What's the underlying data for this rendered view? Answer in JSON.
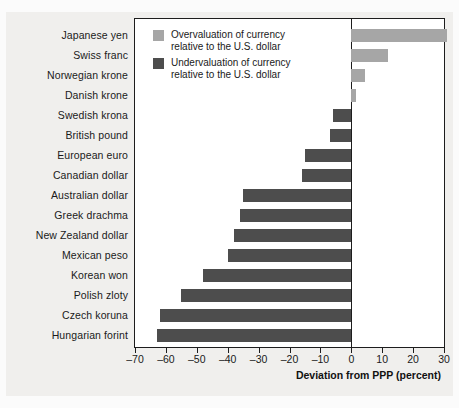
{
  "chart_data": {
    "type": "bar",
    "orientation": "horizontal",
    "title": "",
    "xlabel": "Deviation from PPP (percent)",
    "ylabel": "",
    "xlim": [
      -70,
      30
    ],
    "xticks": [
      -70,
      -60,
      -50,
      -40,
      -30,
      -20,
      -10,
      0,
      10,
      20,
      30
    ],
    "xticklabels": [
      "–70",
      "–60",
      "–50",
      "–40",
      "–30",
      "–20",
      "–10",
      "0",
      "10",
      "20",
      "30"
    ],
    "grid": false,
    "categories": [
      "Japanese yen",
      "Swiss franc",
      "Norwegian krone",
      "Danish krone",
      "Swedish krona",
      "British pound",
      "European euro",
      "Canadian dollar",
      "Australian dollar",
      "Greek drachma",
      "New Zealand dollar",
      "Mexican peso",
      "Korean won",
      "Polish zloty",
      "Czech koruna",
      "Hungarian forint"
    ],
    "values": [
      31,
      12,
      4.5,
      1.5,
      -6,
      -7,
      -15,
      -16,
      -35,
      -36,
      -38,
      -40,
      -48,
      -55,
      -62,
      -63
    ],
    "colors": {
      "positive": "#a6a6a6",
      "negative": "#4d4d4d",
      "axis": "#1d1d1d",
      "plot_background": "#ffffff",
      "figure_background": "#f0efed"
    },
    "legend": {
      "position": "top-left-inside",
      "entries": [
        {
          "key": "positive",
          "line1": "Overvaluation of currency",
          "line2": "relative to the U.S. dollar",
          "color": "#a6a6a6"
        },
        {
          "key": "negative",
          "line1": "Undervaluation of currency",
          "line2": "relative to the U.S. dollar",
          "color": "#4d4d4d"
        }
      ]
    }
  }
}
